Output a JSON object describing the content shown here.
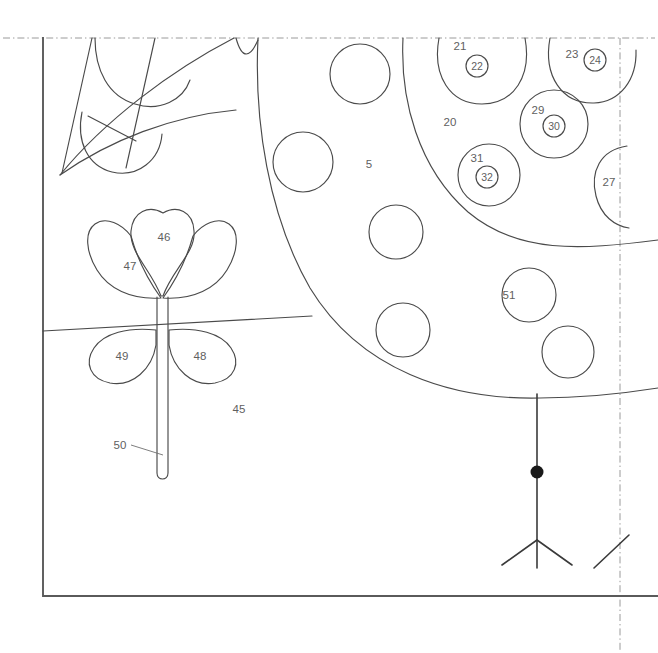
{
  "figure": {
    "stroke_color": "#4a4a4a",
    "frame_color": "#5a5a5a",
    "dash_color": "#9a9a9a",
    "label_color": "#5f5f5f",
    "background": "#ffffff"
  },
  "labels": {
    "canopy_outer": "5",
    "canopy_inner": "20",
    "blob_21": "21",
    "marker_22": "22",
    "blob_23": "23",
    "marker_24": "24",
    "blob_27": "27",
    "blob_29": "29",
    "marker_30": "30",
    "blob_31": "31",
    "marker_32": "32",
    "ground": "45",
    "petal_center": "46",
    "petal_left": "47",
    "leaf_right": "48",
    "leaf_left": "49",
    "stem": "50",
    "leaf_node_51": "51"
  },
  "elements": {
    "frame": "solid-border-left-and-bottom",
    "crop_marks": "dash-dot-border-top-and-right",
    "tree_trunk": "vertical-trunk-with-node-and-roots",
    "horizon": "ground-line",
    "foliage_top_left": "partial-leaf-cluster"
  }
}
